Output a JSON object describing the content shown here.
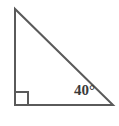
{
  "figure": {
    "type": "right-triangle-diagram",
    "background_color": "#ffffff",
    "stroke_color": "#5a5a5a",
    "stroke_width": 2,
    "label_color": "#3a3a3a",
    "vertices": {
      "apex": {
        "x": 15,
        "y": 9
      },
      "right_angle": {
        "x": 15,
        "y": 105
      },
      "labeled_angle": {
        "x": 113,
        "y": 105
      }
    },
    "right_angle_marker": {
      "name": "right-angle-square",
      "size": 13,
      "x": 15,
      "y": 92
    },
    "angle_label": {
      "value": "40",
      "unit": "°",
      "text": "40°"
    }
  }
}
